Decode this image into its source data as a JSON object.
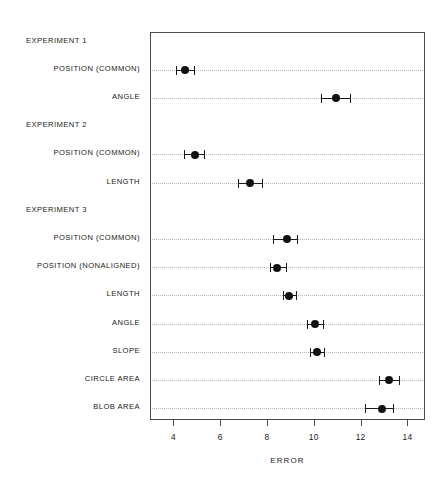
{
  "chart_data": {
    "type": "scatter",
    "title": "",
    "xlabel": "ERROR",
    "ylabel": "",
    "xlim": [
      3.0,
      14.75
    ],
    "ylim": [
      0,
      13
    ],
    "grid": "horizontal-dotted",
    "legend": "none",
    "orientation": "horizontal",
    "error_bars": "horizontal",
    "xticks": [
      4,
      6,
      8,
      10,
      12,
      14
    ],
    "xtick_labels": [
      "4",
      "6",
      "8",
      "10",
      "12",
      "14"
    ],
    "groups": [
      {
        "label": "EXPERIMENT 1",
        "items": [
          {
            "label": "POSITION (COMMON)",
            "value": 4.45,
            "low": 4.05,
            "high": 4.85
          },
          {
            "label": "ANGLE",
            "value": 10.9,
            "low": 10.25,
            "high": 11.5
          }
        ]
      },
      {
        "label": "EXPERIMENT 2",
        "items": [
          {
            "label": "POSITION (COMMON)",
            "value": 4.9,
            "low": 4.4,
            "high": 5.25
          },
          {
            "label": "LENGTH",
            "value": 7.25,
            "low": 6.7,
            "high": 7.75
          }
        ]
      },
      {
        "label": "EXPERIMENT 3",
        "items": [
          {
            "label": "POSITION (COMMON)",
            "value": 8.8,
            "low": 8.2,
            "high": 9.25
          },
          {
            "label": "POSITION (NONALIGNED)",
            "value": 8.4,
            "low": 8.1,
            "high": 8.75
          },
          {
            "label": "LENGTH",
            "value": 8.9,
            "low": 8.65,
            "high": 9.2
          },
          {
            "label": "ANGLE",
            "value": 10.0,
            "low": 9.65,
            "high": 10.35
          },
          {
            "label": "SLOPE",
            "value": 10.1,
            "low": 9.8,
            "high": 10.4
          },
          {
            "label": "CIRCLE AREA",
            "value": 13.15,
            "low": 12.75,
            "high": 13.6
          },
          {
            "label": "BLOB AREA",
            "value": 12.85,
            "low": 12.15,
            "high": 13.35
          }
        ]
      }
    ],
    "rows": [
      {
        "kind": "group",
        "label": "EXPERIMENT 1"
      },
      {
        "kind": "item",
        "label": "POSITION (COMMON)",
        "value": 4.45,
        "low": 4.05,
        "high": 4.85
      },
      {
        "kind": "item",
        "label": "ANGLE",
        "value": 10.9,
        "low": 10.25,
        "high": 11.5
      },
      {
        "kind": "group",
        "label": "EXPERIMENT 2"
      },
      {
        "kind": "item",
        "label": "POSITION (COMMON)",
        "value": 4.9,
        "low": 4.4,
        "high": 5.25
      },
      {
        "kind": "item",
        "label": "LENGTH",
        "value": 7.25,
        "low": 6.7,
        "high": 7.75
      },
      {
        "kind": "group",
        "label": "EXPERIMENT 3"
      },
      {
        "kind": "item",
        "label": "POSITION (COMMON)",
        "value": 8.8,
        "low": 8.2,
        "high": 9.25
      },
      {
        "kind": "item",
        "label": "POSITION (NONALIGNED)",
        "value": 8.4,
        "low": 8.1,
        "high": 8.75
      },
      {
        "kind": "item",
        "label": "LENGTH",
        "value": 8.9,
        "low": 8.65,
        "high": 9.2
      },
      {
        "kind": "item",
        "label": "ANGLE",
        "value": 10.0,
        "low": 9.65,
        "high": 10.35
      },
      {
        "kind": "item",
        "label": "SLOPE",
        "value": 10.1,
        "low": 9.8,
        "high": 10.4
      },
      {
        "kind": "item",
        "label": "CIRCLE AREA",
        "value": 13.15,
        "low": 12.75,
        "high": 13.6
      },
      {
        "kind": "item",
        "label": "BLOB AREA",
        "value": 12.85,
        "low": 12.15,
        "high": 13.35
      }
    ],
    "colors": {
      "point": "#111111",
      "error_bar": "#1a1a1a",
      "grid": "#b9b9b9",
      "frame": "#4a4a4a",
      "text": "#1a1a1a",
      "background": "#ffffff"
    }
  }
}
